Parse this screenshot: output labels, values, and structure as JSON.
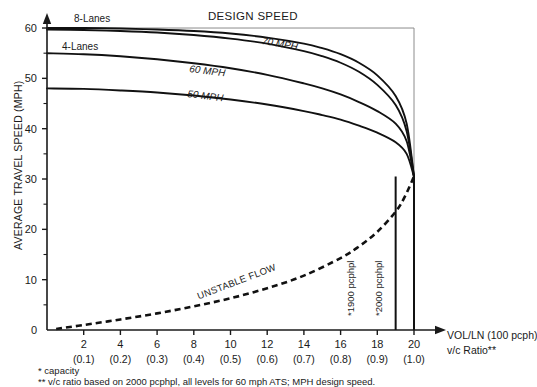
{
  "chart_data": {
    "type": "line",
    "title": "DESIGN SPEED",
    "xlabel_line1": "VOL/LN (100 pcph)",
    "xlabel_line2": "v/c Ratio**",
    "ylabel": "AVERAGE TRAVEL SPEED (MPH)",
    "xlim": [
      0,
      21
    ],
    "ylim": [
      0,
      62
    ],
    "grid": false,
    "x_ticks": [
      2,
      4,
      6,
      8,
      10,
      12,
      14,
      16,
      18,
      20
    ],
    "x_tick_labels": [
      "2",
      "4",
      "6",
      "8",
      "10",
      "12",
      "14",
      "16",
      "18",
      "20"
    ],
    "x_sub_labels": [
      "(0.1)",
      "(0.2)",
      "(0.3)",
      "(0.4)",
      "(0.5)",
      "(0.6)",
      "(0.7)",
      "(0.8)",
      "(0.9)",
      "(1.0)"
    ],
    "y_ticks": [
      0,
      10,
      20,
      30,
      40,
      50,
      60
    ],
    "y_tick_labels": [
      "0",
      "10",
      "20",
      "30",
      "40",
      "50",
      "60"
    ],
    "y_minor_ticks": [
      5,
      15,
      25,
      35,
      45,
      55
    ],
    "series": [
      {
        "name": "70 MPH 8-Lanes",
        "style": "solid",
        "label": "8-Lanes",
        "x": [
          0,
          2,
          4,
          6,
          8,
          10,
          12,
          14,
          15,
          16,
          17,
          18,
          19,
          19.6,
          20
        ],
        "values": [
          60,
          60,
          59.9,
          59.7,
          59.4,
          58.9,
          58.1,
          56.9,
          56.0,
          54.8,
          53.1,
          50.6,
          46.5,
          41.0,
          30.5
        ]
      },
      {
        "name": "70 MPH 4-Lanes",
        "style": "solid",
        "label": "4-Lanes",
        "x": [
          0,
          2,
          4,
          6,
          8,
          10,
          12,
          14,
          15,
          16,
          17,
          18,
          19,
          19.6,
          20
        ],
        "values": [
          59.7,
          59.6,
          59.4,
          59.1,
          58.6,
          57.9,
          56.9,
          55.4,
          54.4,
          53.1,
          51.3,
          48.7,
          44.7,
          39.5,
          30.5
        ]
      },
      {
        "name": "60 MPH",
        "style": "solid",
        "label": "60 MPH",
        "x": [
          0,
          2,
          4,
          6,
          8,
          10,
          12,
          14,
          15,
          16,
          17,
          18,
          19,
          19.6,
          20
        ],
        "values": [
          55,
          54.8,
          54.4,
          53.8,
          53.0,
          52.0,
          50.7,
          49.0,
          48.0,
          46.8,
          45.3,
          43.5,
          41.0,
          37.5,
          30.5
        ]
      },
      {
        "name": "50 MPH",
        "style": "solid",
        "label": "50 MPH",
        "x": [
          0,
          2,
          4,
          6,
          8,
          10,
          12,
          14,
          15,
          16,
          17,
          18,
          19,
          19.6,
          20
        ],
        "values": [
          48,
          47.9,
          47.6,
          47.2,
          46.6,
          45.8,
          44.8,
          43.5,
          42.7,
          41.8,
          40.6,
          39.2,
          37.3,
          35.0,
          30.5
        ]
      },
      {
        "name": "UNSTABLE FLOW",
        "style": "dashed",
        "label": "UNSTABLE FLOW",
        "x": [
          0.5,
          2,
          4,
          6,
          8,
          10,
          12,
          14,
          16,
          17,
          18,
          19,
          19.5,
          20
        ],
        "values": [
          0.2,
          1.0,
          2.1,
          3.3,
          4.7,
          6.3,
          8.3,
          10.8,
          14.3,
          16.6,
          19.5,
          23.5,
          26.5,
          30.5
        ]
      }
    ],
    "annotations": [
      {
        "name": "capacity-line-1900",
        "text": "*1900 pcphpl",
        "x": 19,
        "kind": "vertical-line"
      },
      {
        "name": "capacity-line-2000",
        "text": "*2000 pcphpl",
        "x": 20,
        "kind": "vertical-line"
      }
    ],
    "footnotes": [
      "* capacity",
      "** v/c ratio based on 2000 pcphpl, all levels for 60 mph ATS; MPH design speed."
    ]
  },
  "colors": {
    "curve": "#111111",
    "axis": "#1a1a1a",
    "box": "#8c8c8c",
    "background": "#ffffff"
  }
}
